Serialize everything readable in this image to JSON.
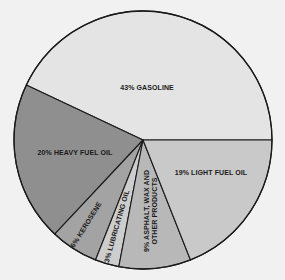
{
  "chart_data": {
    "type": "pie",
    "title": "",
    "center": [
      143,
      140
    ],
    "radius": 129,
    "start_angle_deg": 0,
    "direction": "counterclockwise",
    "outline_color": "#1a1a1a",
    "slices": [
      {
        "label": "43% GASOLINE",
        "name": "Gasoline",
        "value": 43,
        "color": "#e4e4e4"
      },
      {
        "label": "20% HEAVY FUEL OIL",
        "name": "Heavy Fuel Oil",
        "value": 20,
        "color": "#8f8f8f"
      },
      {
        "label": "6% KEROSENE",
        "name": "Kerosene",
        "value": 6,
        "color": "#a3a3a3"
      },
      {
        "label": "3% LUBRICATING OIL",
        "name": "Lubricating Oil",
        "value": 3,
        "color": "#cdcdcd"
      },
      {
        "label": "9% ASPHALT, WAX AND OTHER PRODUCTS",
        "label_lines": [
          "9% ASPHALT, WAX AND",
          "OTHER PRODUCTS"
        ],
        "name": "Asphalt, Wax and Other Products",
        "value": 9,
        "color": "#b8b8b8"
      },
      {
        "label": "19% LIGHT FUEL OIL",
        "name": "Light Fuel Oil",
        "value": 19,
        "color": "#c9c9c9"
      }
    ]
  }
}
